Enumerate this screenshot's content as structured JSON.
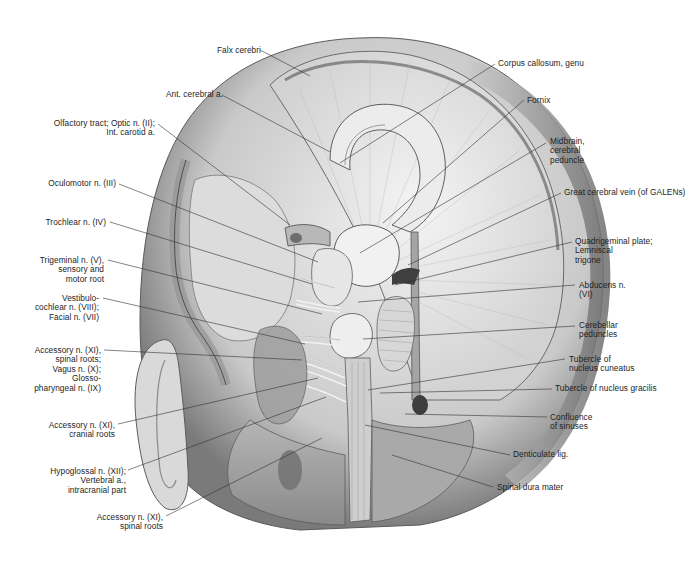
{
  "figure": {
    "type": "anatomical illustration",
    "palette": {
      "background": "#ffffff",
      "tissue_light": "#e8e8e8",
      "tissue_mid": "#bdbdbd",
      "tissue_dark": "#6e6e6e",
      "outline": "#4a4a4a",
      "text": "#1e1e1e",
      "leader": "#333333"
    }
  },
  "labels": [
    {
      "id": "falx-cerebri",
      "text": "Falx cerebri",
      "side": "left",
      "x": 217,
      "y": 46,
      "line": [
        [
          260,
          50
        ],
        [
          310,
          76
        ]
      ]
    },
    {
      "id": "ant-cerebral-a",
      "text": "Ant. cerebral a.",
      "side": "left",
      "x": 166,
      "y": 90,
      "line": [
        [
          222,
          95
        ],
        [
          330,
          152
        ]
      ]
    },
    {
      "id": "olfactory-optic-carotid",
      "text": "Olfactory tract; Optic n. (II);\nInt. carotid a.",
      "side": "right",
      "x": 44,
      "y": 119,
      "w": 111,
      "line": [
        [
          158,
          124
        ],
        [
          290,
          225
        ]
      ]
    },
    {
      "id": "oculomotor-n",
      "text": "Oculomotor n. (III)",
      "side": "right",
      "x": 40,
      "y": 179,
      "w": 76,
      "line": [
        [
          119,
          184
        ],
        [
          318,
          262
        ]
      ]
    },
    {
      "id": "trochlear-n",
      "text": "Trochlear n. (IV)",
      "side": "right",
      "x": 40,
      "y": 218,
      "w": 66,
      "line": [
        [
          110,
          222
        ],
        [
          312,
          284
        ]
      ]
    },
    {
      "id": "trigeminal-n",
      "text": "Trigeminal n. (V),\nsensory and\nmotor root",
      "side": "right",
      "x": 30,
      "y": 256,
      "w": 74,
      "line": [
        [
          108,
          260
        ],
        [
          322,
          314
        ]
      ]
    },
    {
      "id": "vestibulocochlear-facial",
      "text": "Vestibulo-\ncochlear n. (VIII);\nFacial n. (VII)",
      "side": "right",
      "x": 25,
      "y": 294,
      "w": 74,
      "line": [
        [
          103,
          298
        ],
        [
          305,
          344
        ]
      ]
    },
    {
      "id": "accessory-vagus-glosso",
      "text": "Accessory n. (XI),\nspinal roots;\nVagus n. (X);\nGlosso-\npharyngeal n. (IX)",
      "side": "right",
      "x": 25,
      "y": 346,
      "w": 76,
      "line": [
        [
          104,
          350
        ],
        [
          302,
          360
        ]
      ]
    },
    {
      "id": "accessory-cranial",
      "text": "Accessory n. (XI),\ncranial roots",
      "side": "right",
      "x": 40,
      "y": 421,
      "w": 75,
      "line": [
        [
          118,
          424
        ],
        [
          318,
          378
        ]
      ]
    },
    {
      "id": "hypoglossal-vertebral",
      "text": "Hypoglossal n. (XII);\nVertebral a.,\nintracranial part",
      "side": "right",
      "x": 40,
      "y": 467,
      "w": 86,
      "line": [
        [
          128,
          470
        ],
        [
          326,
          397
        ]
      ]
    },
    {
      "id": "accessory-spinal",
      "text": "Accessory n. (XI),\nspinal roots",
      "side": "right",
      "x": 60,
      "y": 513,
      "w": 103,
      "line": [
        [
          166,
          516
        ],
        [
          322,
          438
        ]
      ]
    },
    {
      "id": "corpus-callosum-genu",
      "text": "Corpus callosum, genu",
      "side": "left",
      "x": 498,
      "y": 59,
      "line": [
        [
          495,
          64
        ],
        [
          340,
          163
        ]
      ]
    },
    {
      "id": "fornix",
      "text": "Fornix",
      "side": "left",
      "x": 527,
      "y": 96,
      "line": [
        [
          524,
          100
        ],
        [
          383,
          223
        ]
      ]
    },
    {
      "id": "midbrain-peduncle",
      "text": "Midbrain,\ncerebral\npeduncle",
      "side": "left",
      "x": 550,
      "y": 137,
      "w": 60,
      "line": [
        [
          546,
          143
        ],
        [
          360,
          253
        ]
      ]
    },
    {
      "id": "great-cerebral-vein",
      "text": "Great cerebral vein (of GALENs)",
      "side": "left",
      "x": 564,
      "y": 188,
      "line": [
        [
          561,
          193
        ],
        [
          408,
          265
        ]
      ]
    },
    {
      "id": "quadrigeminal-plate",
      "text": "Quadrigeminal plate;\nLemniscal\ntrigone",
      "side": "left",
      "x": 575,
      "y": 237,
      "w": 90,
      "line": [
        [
          572,
          242
        ],
        [
          395,
          285
        ]
      ]
    },
    {
      "id": "abducens-n",
      "text": "Abducens n.\n(VI)",
      "side": "left",
      "x": 579,
      "y": 281,
      "w": 60,
      "line": [
        [
          575,
          285
        ],
        [
          358,
          302
        ]
      ]
    },
    {
      "id": "cerebellar-peduncles",
      "text": "Cerebellar\npeduncles",
      "side": "left",
      "x": 579,
      "y": 321,
      "w": 60,
      "line": [
        [
          575,
          326
        ],
        [
          363,
          339
        ]
      ]
    },
    {
      "id": "tubercle-cuneatus",
      "text": "Tubercle of\nnucleus cuneatus",
      "side": "left",
      "x": 569,
      "y": 355,
      "w": 80,
      "line": [
        [
          565,
          359
        ],
        [
          368,
          390
        ]
      ]
    },
    {
      "id": "tubercle-gracilis",
      "text": "Tubercle of nucleus gracilis",
      "side": "left",
      "x": 555,
      "y": 384,
      "line": [
        [
          552,
          389
        ],
        [
          380,
          393
        ]
      ]
    },
    {
      "id": "confluence-sinuses",
      "text": "Confluence\nof sinuses",
      "side": "left",
      "x": 550,
      "y": 413,
      "w": 60,
      "line": [
        [
          547,
          417
        ],
        [
          405,
          414
        ]
      ]
    },
    {
      "id": "denticulate-lig",
      "text": "Denticulate lig.",
      "side": "left",
      "x": 513,
      "y": 450,
      "line": [
        [
          510,
          455
        ],
        [
          365,
          425
        ]
      ]
    },
    {
      "id": "spinal-dura-mater",
      "text": "Spinal dura mater",
      "side": "left",
      "x": 497,
      "y": 483,
      "line": [
        [
          493,
          487
        ],
        [
          392,
          455
        ]
      ]
    }
  ]
}
